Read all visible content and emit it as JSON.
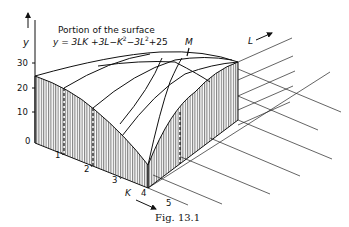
{
  "figure": {
    "title_line1": "Portion of the surface",
    "equation": "y = 3LK + 3L − K² − 3L² + 25",
    "equation_parts": {
      "y": "y",
      "eq": " = 3LK +3L−K",
      "sup1": "2",
      "mid": "−3L",
      "sup2": "2",
      "tail": "+25"
    },
    "caption": "Fig. 13.1",
    "max_point_label": "M"
  },
  "axes": {
    "y_label": "y",
    "y_ticks": [
      "30",
      "20",
      "10",
      "0"
    ],
    "k_label": "K",
    "k_ticks": [
      "1",
      "2",
      "3",
      "4",
      "5"
    ],
    "l_label": "L"
  },
  "colors": {
    "ink": "#111111",
    "background": "#ffffff"
  }
}
